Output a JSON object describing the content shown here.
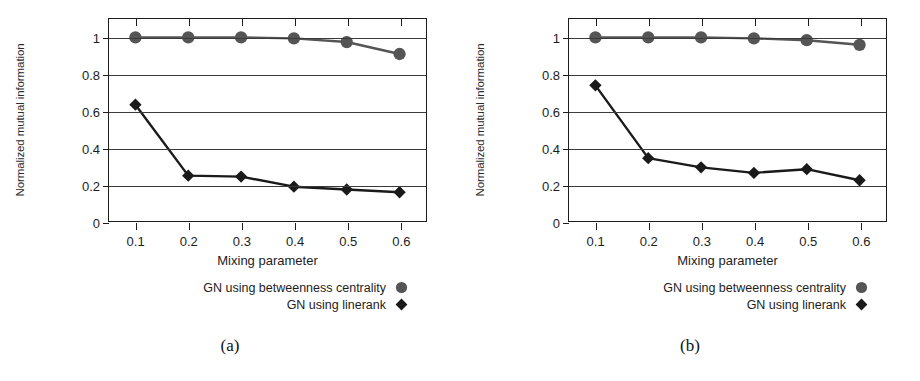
{
  "figure": {
    "panels": [
      {
        "caption": "(a)",
        "chart_data": {
          "type": "line",
          "title": "",
          "xlabel": "Mixing parameter",
          "ylabel": "Normalized mutual information",
          "x": [
            0.1,
            0.2,
            0.3,
            0.4,
            0.5,
            0.6
          ],
          "xtick_labels": [
            "0.1",
            "0.2",
            "0.3",
            "0.4",
            "0.5",
            "0.6"
          ],
          "ytick_labels": [
            "0",
            "0.2",
            "0.4",
            "0.6",
            "0.8",
            "1"
          ],
          "yticks": [
            0,
            0.2,
            0.4,
            0.6,
            0.8,
            1
          ],
          "xlim": [
            0.05,
            0.65
          ],
          "ylim": [
            0,
            1.1
          ],
          "grid": true,
          "legend_position": "below-right",
          "series": [
            {
              "name": "GN using betweenness centrality",
              "marker": "circle",
              "color": "#555555",
              "values": [
                1.0,
                1.0,
                1.0,
                0.995,
                0.975,
                0.91
              ]
            },
            {
              "name": "GN using linerank",
              "marker": "diamond",
              "color": "#1a1a1a",
              "values": [
                0.635,
                0.25,
                0.245,
                0.19,
                0.175,
                0.16
              ]
            }
          ]
        }
      },
      {
        "caption": "(b)",
        "chart_data": {
          "type": "line",
          "title": "",
          "xlabel": "Mixing parameter",
          "ylabel": "Normalized mutual information",
          "x": [
            0.1,
            0.2,
            0.3,
            0.4,
            0.5,
            0.6
          ],
          "xtick_labels": [
            "0.1",
            "0.2",
            "0.3",
            "0.4",
            "0.5",
            "0.6"
          ],
          "ytick_labels": [
            "0",
            "0.2",
            "0.4",
            "0.6",
            "0.8",
            "1"
          ],
          "yticks": [
            0,
            0.2,
            0.4,
            0.6,
            0.8,
            1
          ],
          "xlim": [
            0.05,
            0.65
          ],
          "ylim": [
            0,
            1.1
          ],
          "grid": true,
          "legend_position": "below-right",
          "series": [
            {
              "name": "GN using betweenness centrality",
              "marker": "circle",
              "color": "#555555",
              "values": [
                1.0,
                1.0,
                1.0,
                0.995,
                0.985,
                0.96
              ]
            },
            {
              "name": "GN using linerank",
              "marker": "diamond",
              "color": "#1a1a1a",
              "values": [
                0.74,
                0.345,
                0.295,
                0.265,
                0.285,
                0.225
              ]
            }
          ]
        }
      }
    ]
  }
}
